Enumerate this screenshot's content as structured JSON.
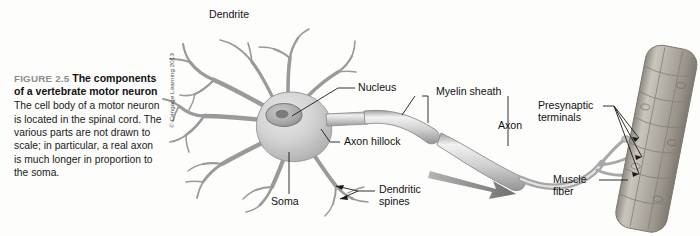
{
  "figure": {
    "number": "FIGURE 2.5",
    "title": "The components of a vertebrate motor neuron",
    "body": "The cell body of a motor neuron is located in the spinal cord. The various parts are not drawn to scale; in particular, a real axon is much longer in proportion to the soma.",
    "copyright": "© Cengage Learning 2013"
  },
  "labels": {
    "dendrite": "Dendrite",
    "nucleus": "Nucleus",
    "axon_hillock": "Axon hillock",
    "soma": "Soma",
    "dendritic_spines_line1": "Dendritic",
    "dendritic_spines_line2": "spines",
    "myelin_sheath": "Myelin sheath",
    "axon": "Axon",
    "presynaptic_line1": "Presynaptic",
    "presynaptic_line2": "terminals",
    "muscle_line1": "Muscle",
    "muscle_line2": "fiber"
  },
  "colors": {
    "background": "#fdfdfb",
    "cell_fill_light": "#dcdcdc",
    "cell_fill_mid": "#c2c2c2",
    "cell_fill_dark": "#9e9e9e",
    "outline": "#8a8a8a",
    "leader_line": "#1a1a1a",
    "text": "#111111",
    "fig_num": "#8d8d8d",
    "arrow": "#8f8f8f",
    "muscle_fill": "#b9b5ad",
    "muscle_dark": "#8f8a82"
  }
}
